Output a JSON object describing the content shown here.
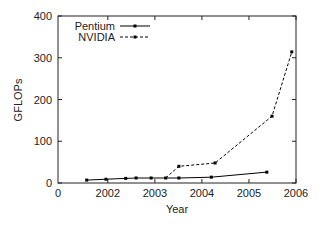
{
  "chart_data": {
    "type": "line",
    "title": "",
    "xlabel": "Year",
    "ylabel": "GFLOPs",
    "xlim": [
      2000.94,
      2006
    ],
    "ylim": [
      0,
      400
    ],
    "x_ticks": [
      {
        "value": 2000.94,
        "label": "0"
      },
      {
        "value": 2002,
        "label": "2002"
      },
      {
        "value": 2003,
        "label": "2003"
      },
      {
        "value": 2004,
        "label": "2004"
      },
      {
        "value": 2005,
        "label": "2005"
      },
      {
        "value": 2006,
        "label": "2006"
      }
    ],
    "y_ticks": [
      {
        "value": 0,
        "label": "0"
      },
      {
        "value": 100,
        "label": "100"
      },
      {
        "value": 200,
        "label": "200"
      },
      {
        "value": 300,
        "label": "300"
      },
      {
        "value": 400,
        "label": "400"
      }
    ],
    "grid": false,
    "legend_position": "top-left",
    "series": [
      {
        "name": "Pentium",
        "style": "solid",
        "color": "#000000",
        "x": [
          2001.55,
          2001.96,
          2002.38,
          2002.6,
          2002.92,
          2003.51,
          2004.2,
          2005.38
        ],
        "values": [
          7,
          9,
          11,
          12,
          12,
          12,
          14,
          26
        ]
      },
      {
        "name": "NVIDIA",
        "style": "dashed",
        "color": "#000000",
        "x": [
          2003.23,
          2003.51,
          2004.28,
          2005.49,
          2005.91
        ],
        "values": [
          12,
          40,
          48,
          160,
          314
        ]
      }
    ]
  }
}
